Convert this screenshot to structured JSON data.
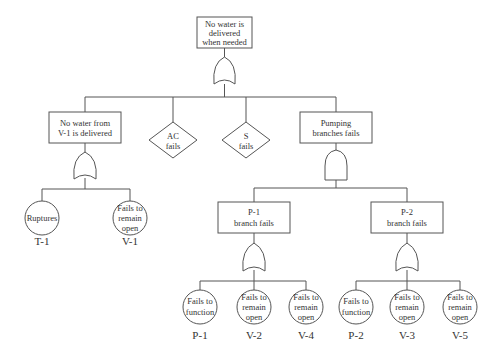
{
  "diagram": {
    "type": "fault-tree",
    "top_event": {
      "lines": [
        "No water is",
        "delivered",
        "when needed"
      ],
      "gate": "OR"
    },
    "intermediate_events": {
      "no_water_v1": {
        "lines": [
          "No water from",
          "V-1 is delivered"
        ],
        "gate": "OR"
      },
      "pumping_branches": {
        "lines": [
          "Pumping",
          "branches fails"
        ],
        "gate": "AND"
      },
      "p1_branch": {
        "lines": [
          "P-1",
          "branch fails"
        ],
        "gate": "OR"
      },
      "p2_branch": {
        "lines": [
          "P-2",
          "branch fails"
        ],
        "gate": "OR"
      }
    },
    "undeveloped_events": {
      "ac": {
        "lines": [
          "AC",
          "fails"
        ]
      },
      "s": {
        "lines": [
          "S",
          "fails"
        ]
      }
    },
    "basic_events": {
      "t1": {
        "lines": [
          "Ruptures"
        ],
        "label": "T-1"
      },
      "v1": {
        "lines": [
          "Fails to",
          "remain",
          "open"
        ],
        "label": "V-1"
      },
      "p1": {
        "lines": [
          "Fails to",
          "function"
        ],
        "label": "P-1"
      },
      "v2": {
        "lines": [
          "Fails to",
          "remain",
          "open"
        ],
        "label": "V-2"
      },
      "v4": {
        "lines": [
          "Fails to",
          "remain",
          "open"
        ],
        "label": "V-4"
      },
      "p2": {
        "lines": [
          "Fails to",
          "function"
        ],
        "label": "P-2"
      },
      "v3": {
        "lines": [
          "Fails to",
          "remain",
          "open"
        ],
        "label": "V-3"
      },
      "v5": {
        "lines": [
          "Fails to",
          "remain",
          "open"
        ],
        "label": "V-5"
      }
    },
    "colors": {
      "line": "#555555",
      "text": "#333333",
      "background": "#ffffff"
    }
  }
}
